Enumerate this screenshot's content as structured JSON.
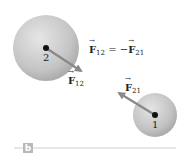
{
  "diagram": {
    "panel_label": "b",
    "equation": {
      "lhs_symbol": "F",
      "lhs_sub": "12",
      "operator": "= −",
      "rhs_symbol": "F",
      "rhs_sub": "21"
    },
    "particles": [
      {
        "id": "2",
        "label": "2",
        "cx": 46,
        "cy": 48,
        "r": 33
      },
      {
        "id": "1",
        "label": "1",
        "cx": 155,
        "cy": 115,
        "r": 22
      }
    ],
    "forces": [
      {
        "name": "F12",
        "symbol": "F",
        "sub": "12",
        "from": [
          46,
          48
        ],
        "to": [
          83,
          72
        ]
      },
      {
        "name": "F21",
        "symbol": "F",
        "sub": "21",
        "from": [
          155,
          115
        ],
        "to": [
          117,
          92
        ]
      }
    ],
    "colors": {
      "sphere_light": "#e4e4e4",
      "sphere_dark": "#a8a8a8",
      "arrow": "#8a8a8a",
      "dot": "#111111",
      "rule": "#cfcfcf",
      "badge": "#b8b8b8"
    }
  }
}
